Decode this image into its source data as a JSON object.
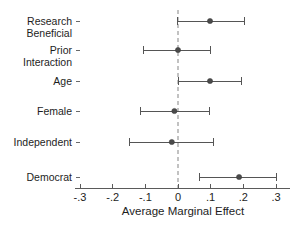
{
  "chart_data": {
    "type": "scatter",
    "subtype": "dot-and-whisker-coefficient-plot",
    "title": "",
    "xlabel": "Average Marginal Effect",
    "ylabel": "",
    "xlim": [
      -0.3,
      0.3
    ],
    "xticks": [
      -0.3,
      -0.2,
      -0.1,
      0,
      0.1,
      0.2,
      0.3
    ],
    "xticklabels": [
      "-.3",
      "-.2",
      "-.1",
      "0",
      ".1",
      ".2",
      ".3"
    ],
    "grid": false,
    "legend": null,
    "reference_line": {
      "value": 0,
      "style": "dashed",
      "color": "#9a9a9a",
      "orientation": "vertical"
    },
    "categories": [
      "Research Beneficial",
      "Prior Interaction",
      "Age",
      "Female",
      "Independent",
      "Democrat"
    ],
    "values": [
      0.098,
      0.0,
      0.098,
      -0.011,
      -0.019,
      0.187
    ],
    "ci_low": [
      -0.003,
      -0.107,
      0.0,
      -0.116,
      -0.15,
      0.067
    ],
    "ci_high": [
      0.205,
      0.098,
      0.193,
      0.095,
      0.108,
      0.3
    ],
    "points": [
      {
        "label": "Research Beneficial",
        "label_line1": "Research",
        "label_line2": "Beneficial",
        "estimate": 0.098,
        "ci_low": -0.003,
        "ci_high": 0.205
      },
      {
        "label": "Prior Interaction",
        "label_line1": "Prior",
        "label_line2": "Interaction",
        "estimate": 0.0,
        "ci_low": -0.107,
        "ci_high": 0.098
      },
      {
        "label": "Age",
        "label_line1": "Age",
        "label_line2": "",
        "estimate": 0.098,
        "ci_low": 0.0,
        "ci_high": 0.193
      },
      {
        "label": "Female",
        "label_line1": "Female",
        "label_line2": "",
        "estimate": -0.011,
        "ci_low": -0.116,
        "ci_high": 0.095
      },
      {
        "label": "Independent",
        "label_line1": "Independent",
        "label_line2": "",
        "estimate": -0.019,
        "ci_low": -0.15,
        "ci_high": 0.108
      },
      {
        "label": "Democrat",
        "label_line1": "Democrat",
        "label_line2": "",
        "estimate": 0.187,
        "ci_low": 0.067,
        "ci_high": 0.3
      }
    ],
    "colors": {
      "marker": "#4a4a4a",
      "whisker": "#555555",
      "axis": "#5a5a5a",
      "reference": "#9a9a9a",
      "text": "#1d1d1d",
      "background": "#ffffff"
    }
  }
}
